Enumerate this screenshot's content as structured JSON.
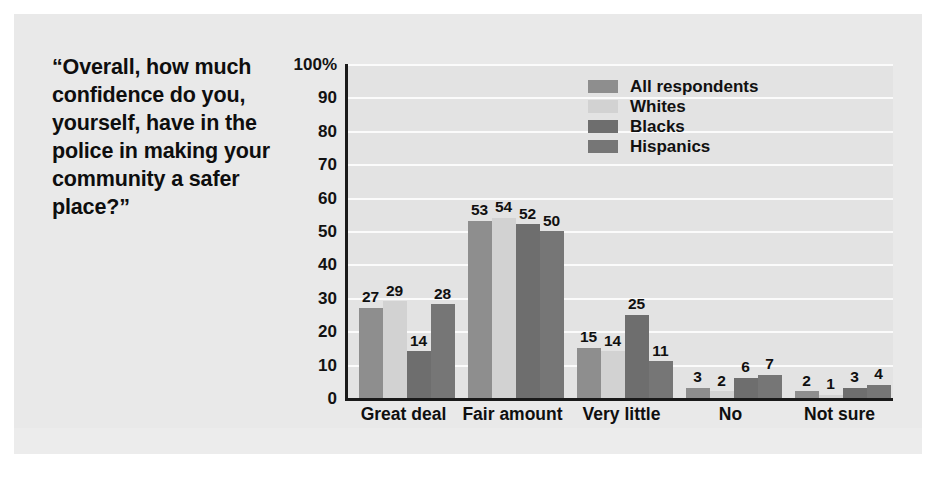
{
  "chart_data": {
    "type": "bar",
    "title": "“Overall, how much confidence do you, yourself, have in the police in making your community a safer place?”",
    "xlabel": "",
    "ylabel": "",
    "ylim": [
      0,
      100
    ],
    "ytick_labels": [
      "100%",
      "90",
      "80",
      "70",
      "60",
      "50",
      "40",
      "30",
      "20",
      "10",
      "0"
    ],
    "ytick_values": [
      100,
      90,
      80,
      70,
      60,
      50,
      40,
      30,
      20,
      10,
      0
    ],
    "grid": true,
    "grid_axis": "y",
    "legend_position": "top-right",
    "categories": [
      "Great deal",
      "Fair amount",
      "Very little",
      "No",
      "Not sure"
    ],
    "series": [
      {
        "name": "All respondents",
        "color": "#8e8e8e",
        "values": [
          27,
          53,
          15,
          3,
          2
        ]
      },
      {
        "name": "Whites",
        "color": "#d2d2d2",
        "values": [
          29,
          54,
          14,
          2,
          1
        ]
      },
      {
        "name": "Blacks",
        "color": "#6e6e6e",
        "values": [
          14,
          52,
          25,
          6,
          3
        ]
      },
      {
        "name": "Hispanics",
        "color": "#767676",
        "values": [
          28,
          50,
          11,
          7,
          4
        ]
      }
    ]
  },
  "figure": {
    "background": "#e9e9e9",
    "plot_background": "#e3e3e3",
    "gridline_color": "#fbfbfb",
    "axis_color": "#1a1a1a",
    "text_color": "#0f0f0f"
  }
}
